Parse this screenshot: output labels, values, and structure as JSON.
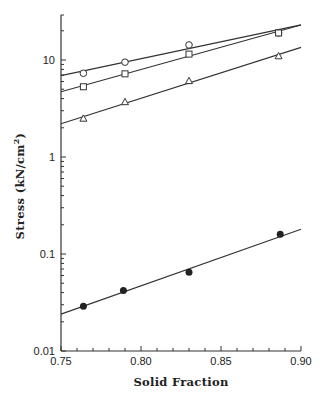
{
  "chart_data": {
    "type": "scatter",
    "title": "",
    "xlabel": "Solid Fraction",
    "ylabel": "Stress (kN/cm²)",
    "ylabel_parts": {
      "main": "Stress (kN/cm",
      "sup": "2",
      "close": ")"
    },
    "xlim": [
      0.75,
      0.9
    ],
    "ylim": [
      0.01,
      30
    ],
    "yscale": "log",
    "grid": false,
    "legend": "none",
    "x_ticks": [
      0.75,
      0.8,
      0.85,
      0.9
    ],
    "x_tick_labels": [
      "0.75",
      "0.80",
      "0.85",
      "0.90"
    ],
    "y_ticks": [
      0.01,
      0.1,
      1,
      10
    ],
    "y_tick_labels": [
      "0.01",
      "0.1",
      "1",
      "10"
    ],
    "series": [
      {
        "name": "open-circle",
        "marker": "circle-open",
        "x": [
          0.764,
          0.79,
          0.83,
          0.886
        ],
        "y": [
          7.3,
          9.5,
          14.3,
          19.0
        ],
        "fit": {
          "x": [
            0.75,
            0.9
          ],
          "y": [
            6.9,
            23.0
          ]
        }
      },
      {
        "name": "open-square",
        "marker": "square-open",
        "x": [
          0.764,
          0.79,
          0.83,
          0.886
        ],
        "y": [
          5.3,
          7.2,
          11.5,
          19.0
        ],
        "fit": {
          "x": [
            0.75,
            0.9
          ],
          "y": [
            4.7,
            23.0
          ]
        }
      },
      {
        "name": "open-triangle",
        "marker": "triangle-open",
        "x": [
          0.764,
          0.79,
          0.83,
          0.886
        ],
        "y": [
          2.5,
          3.7,
          6.1,
          11.0
        ],
        "fit": {
          "x": [
            0.75,
            0.9
          ],
          "y": [
            2.2,
            13.5
          ]
        }
      },
      {
        "name": "filled-circle",
        "marker": "circle-filled",
        "x": [
          0.764,
          0.789,
          0.83,
          0.887
        ],
        "y": [
          0.029,
          0.042,
          0.065,
          0.16
        ],
        "fit": {
          "x": [
            0.75,
            0.9
          ],
          "y": [
            0.024,
            0.18
          ]
        }
      }
    ]
  }
}
